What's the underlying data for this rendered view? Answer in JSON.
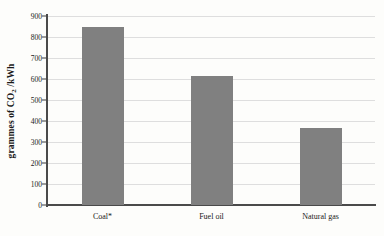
{
  "chart_data": {
    "type": "bar",
    "title": "",
    "subtitle": "",
    "xlabel": "",
    "ylabel": "grammes of CO2 /kWh",
    "ylabel_parts": {
      "prefix": "grammes of CO",
      "subscript": "2",
      "suffix": " /kWh"
    },
    "categories": [
      "Coal*",
      "Fuel oil",
      "Natural gas"
    ],
    "values": [
      850,
      615,
      365
    ],
    "ylim": [
      0,
      900
    ],
    "yticks": [
      0,
      100,
      200,
      300,
      400,
      500,
      600,
      700,
      800,
      900
    ],
    "ytick_labels": [
      "0",
      "100",
      "200",
      "300",
      "400",
      "500",
      "600",
      "700",
      "800",
      "900"
    ],
    "grid": true,
    "grid_axis": "y",
    "legend": false,
    "legend_position": "none",
    "annotations": [
      "*"
    ],
    "series": [
      {
        "name": "CO2 intensity",
        "values": [
          850,
          615,
          365
        ]
      }
    ],
    "colors": {
      "bar_fill": "#808080",
      "gridline": "#dedede",
      "axis": "#4a4a4a",
      "background": "#fdfdfb",
      "text": "#1a1a1a"
    }
  }
}
